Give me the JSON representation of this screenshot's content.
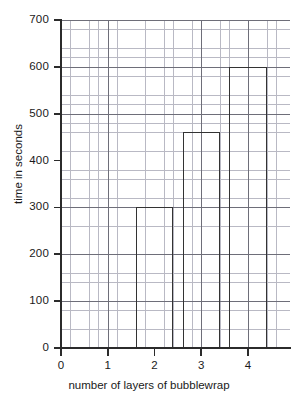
{
  "chart_data": {
    "type": "bar",
    "title": "",
    "xlabel": "number of layers of bubblewrap",
    "ylabel": "time in seconds",
    "categories": [
      "2",
      "3",
      "4"
    ],
    "values": [
      300,
      460,
      600
    ],
    "bar_intervals": [
      [
        1.6,
        2.4
      ],
      [
        2.6,
        3.4
      ],
      [
        3.6,
        4.4
      ]
    ],
    "x": [
      2,
      3,
      4
    ],
    "xlim": [
      0,
      4.9
    ],
    "ylim": [
      0,
      700
    ],
    "yticks": [
      0,
      100,
      200,
      300,
      400,
      500,
      600,
      700
    ],
    "ytick_labels": [
      "0",
      "100",
      "200",
      "300",
      "400",
      "500",
      "600",
      "700"
    ],
    "xticks": [
      0,
      1,
      2,
      3,
      4
    ],
    "xtick_labels": [
      "0",
      "1",
      "2",
      "3",
      "4"
    ],
    "grid": true,
    "grid_minor_divisions": 5,
    "legend": null,
    "bar_style": "outlined-hollow",
    "bar_edge_color": "#333333",
    "bar_fill_color": "#ffffff",
    "grid_major_color": "#6e6e79",
    "grid_minor_color": "#b9b9c4",
    "axis_color": "#2b2b2b",
    "background_color": "#ffffff"
  }
}
